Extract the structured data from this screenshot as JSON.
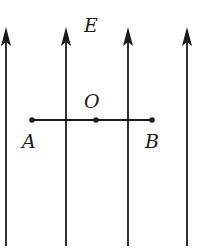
{
  "diagram": {
    "field_label": "E",
    "points": [
      {
        "id": "A",
        "label": "A",
        "x": 32,
        "y": 120,
        "lx": 22,
        "ly": 148
      },
      {
        "id": "O",
        "label": "O",
        "x": 96,
        "y": 120,
        "lx": 84,
        "ly": 108
      },
      {
        "id": "B",
        "label": "B",
        "x": 152,
        "y": 120,
        "lx": 145,
        "ly": 148
      }
    ],
    "field_lines": [
      {
        "x": 6,
        "y_top": 27,
        "y_bottom": 246,
        "direction": "up"
      },
      {
        "x": 66,
        "y_top": 27,
        "y_bottom": 246,
        "direction": "up"
      },
      {
        "x": 128,
        "y_top": 27,
        "y_bottom": 246,
        "direction": "up"
      },
      {
        "x": 187,
        "y_top": 27,
        "y_bottom": 246,
        "direction": "up"
      }
    ],
    "segment": {
      "from": "A",
      "to": "B"
    },
    "colors": {
      "stroke": "#1a1a1a",
      "background": "#ffffff"
    }
  }
}
